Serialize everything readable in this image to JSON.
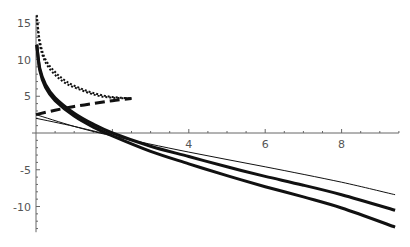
{
  "chart_data": {
    "type": "line",
    "title": "",
    "xlabel": "",
    "ylabel": "",
    "xlim": [
      0,
      9.5
    ],
    "ylim": [
      -13.5,
      16
    ],
    "grid": false,
    "legend": null,
    "x_ticks": [
      {
        "value": 4,
        "label": "4"
      },
      {
        "value": 6,
        "label": "6"
      },
      {
        "value": 8,
        "label": "8"
      }
    ],
    "y_ticks": [
      {
        "value": 15,
        "label": "15"
      },
      {
        "value": 10,
        "label": "10"
      },
      {
        "value": 5,
        "label": "5"
      },
      {
        "value": -5,
        "label": "-5"
      },
      {
        "value": -10,
        "label": "-10"
      }
    ],
    "series": [
      {
        "name": "thick-solid-upper",
        "style": "solid",
        "width": 3,
        "x": [
          0.02,
          0.1,
          0.25,
          0.5,
          1,
          1.5,
          2,
          3,
          4,
          5,
          6,
          7,
          8,
          9.4
        ],
        "y": [
          12,
          8.8,
          6.6,
          4.8,
          2.7,
          1.2,
          0,
          -1.8,
          -3.2,
          -4.6,
          -5.9,
          -7.1,
          -8.4,
          -10.5
        ]
      },
      {
        "name": "thick-solid-lower",
        "style": "solid",
        "width": 3,
        "x": [
          0.02,
          0.1,
          0.25,
          0.5,
          1,
          1.5,
          2,
          3,
          4,
          5,
          6,
          7,
          8,
          9.4
        ],
        "y": [
          12,
          8.5,
          6.2,
          4.4,
          2.3,
          0.8,
          -0.4,
          -2.5,
          -4.2,
          -5.8,
          -7.3,
          -8.7,
          -10.2,
          -12.8
        ]
      },
      {
        "name": "thin-solid-a",
        "style": "solid",
        "width": 1,
        "x": [
          0,
          1,
          2,
          4,
          6,
          8,
          9.4
        ],
        "y": [
          2.5,
          0.9,
          -0.4,
          -2.6,
          -4.6,
          -6.7,
          -8.4
        ]
      },
      {
        "name": "thin-solid-b",
        "style": "solid",
        "width": 1,
        "x": [
          0,
          1,
          1.8
        ],
        "y": [
          2.0,
          0.9,
          -0.1
        ]
      },
      {
        "name": "dotted-upper",
        "style": "dotted",
        "width": 2,
        "x": [
          0.02,
          0.1,
          0.25,
          0.5,
          0.8,
          1.2,
          1.6,
          2.0,
          2.5
        ],
        "y": [
          16,
          12.5,
          10,
          8.3,
          7,
          6,
          5.3,
          4.9,
          4.7
        ]
      },
      {
        "name": "dotted-lower",
        "style": "dotted",
        "width": 2,
        "x": [
          0.02,
          0.1,
          0.25,
          0.5,
          0.8,
          1.2,
          1.6,
          2.0,
          2.5
        ],
        "y": [
          15.5,
          12,
          9.6,
          7.9,
          6.7,
          5.8,
          5.1,
          4.8,
          4.7
        ]
      },
      {
        "name": "thick-dashed",
        "style": "dashed",
        "width": 3,
        "x": [
          0,
          0.5,
          1,
          1.5,
          2,
          2.5
        ],
        "y": [
          2.5,
          3.1,
          3.6,
          4.0,
          4.4,
          4.7
        ]
      }
    ]
  }
}
